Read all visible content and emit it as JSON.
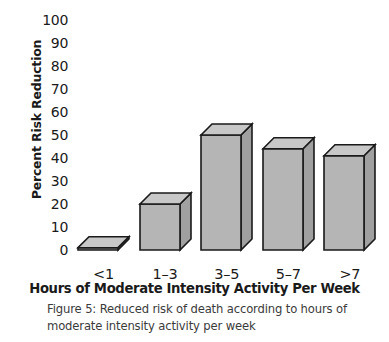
{
  "chart_data": {
    "type": "bar",
    "title": "",
    "xlabel": "Hours of Moderate Intensity Activity Per Week",
    "ylabel": "Percent Risk Reduction",
    "categories": [
      "<1",
      "1–3",
      "3–5",
      "5–7",
      ">7"
    ],
    "values": [
      1,
      20,
      50,
      44,
      41
    ],
    "ylim": [
      0,
      100
    ],
    "yticks": [
      100,
      90,
      80,
      70,
      60,
      50,
      40,
      30,
      20,
      10,
      0
    ],
    "grid": false,
    "legend": null,
    "style": "3d-blocks",
    "series": [
      {
        "name": "Percent Risk Reduction",
        "values": [
          1,
          20,
          50,
          44,
          41
        ]
      }
    ]
  },
  "caption": {
    "line1": "Figure 5: Reduced risk of death according to hours of",
    "line2": "moderate intensity activity per week"
  },
  "colors": {
    "bar_front": "#b5b5b5",
    "bar_top": "#c8c8c8",
    "bar_side": "#a0a0a0",
    "bar_outline": "#1a1a1a",
    "text": "#1a1a1a",
    "caption_text": "#3b3b3b",
    "background": "#ffffff"
  }
}
